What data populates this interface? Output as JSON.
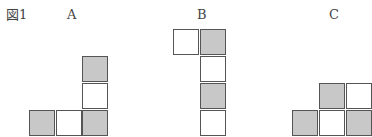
{
  "figure": {
    "caption": "図1",
    "caption_number": "1",
    "panels": [
      {
        "label": "A",
        "label_pos": [
          67,
          8
        ],
        "cells": [
          {
            "x": 82,
            "y": 56,
            "shaded": true
          },
          {
            "x": 82,
            "y": 83,
            "shaded": false
          },
          {
            "x": 29,
            "y": 110,
            "shaded": true
          },
          {
            "x": 56,
            "y": 110,
            "shaded": false
          },
          {
            "x": 82,
            "y": 110,
            "shaded": true
          }
        ]
      },
      {
        "label": "B",
        "label_pos": [
          197,
          8
        ],
        "cells": [
          {
            "x": 173,
            "y": 29,
            "shaded": false
          },
          {
            "x": 200,
            "y": 29,
            "shaded": true
          },
          {
            "x": 200,
            "y": 56,
            "shaded": false
          },
          {
            "x": 200,
            "y": 83,
            "shaded": true
          },
          {
            "x": 200,
            "y": 110,
            "shaded": false
          }
        ]
      },
      {
        "label": "C",
        "label_pos": [
          329,
          8
        ],
        "cells": [
          {
            "x": 319,
            "y": 83,
            "shaded": true
          },
          {
            "x": 346,
            "y": 83,
            "shaded": false
          },
          {
            "x": 292,
            "y": 110,
            "shaded": true
          },
          {
            "x": 319,
            "y": 110,
            "shaded": false
          },
          {
            "x": 346,
            "y": 110,
            "shaded": true
          }
        ]
      }
    ],
    "colors": {
      "shaded": "#c8c8c8",
      "border": "#555555",
      "background": "#ffffff"
    }
  }
}
